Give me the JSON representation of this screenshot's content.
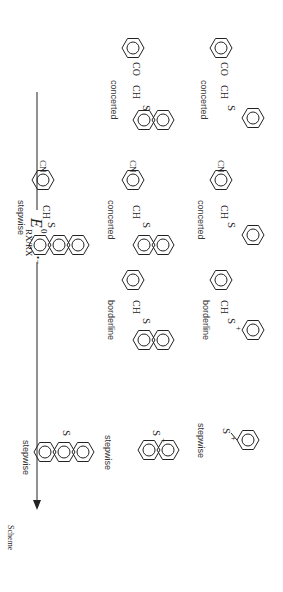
{
  "axis": {
    "label_main": "E",
    "label_sup": "0",
    "label_sub": "RX/RX",
    "label_radical": "•−",
    "direction": "increasing to the right (top-to-bottom in image)"
  },
  "columns": [
    {
      "substituent": "none (S-methyl, S-methyl)",
      "rows": [
        {
          "aryl": "phenyl",
          "label": "stepwise"
        },
        {
          "aryl": "1-naphthyl",
          "label": "stepwise"
        },
        {
          "aryl": "9-anthryl",
          "label": "stepwise"
        }
      ]
    },
    {
      "substituent": "CH2-phenyl",
      "rows": [
        {
          "aryl": "phenyl",
          "label": "borderline"
        },
        {
          "aryl": "1-naphthyl",
          "label": "borderline"
        }
      ]
    },
    {
      "substituent": "CH2-(4-cyanophenyl)",
      "rows": [
        {
          "aryl": "phenyl",
          "label": "concerted"
        },
        {
          "aryl": "1-naphthyl",
          "label": "concerted"
        },
        {
          "aryl": "9-anthryl",
          "label": "stepwise"
        }
      ]
    },
    {
      "substituent": "CH2-CO-phenyl",
      "rows": [
        {
          "aryl": "phenyl",
          "label": "concerted"
        },
        {
          "aryl": "1-naphthyl",
          "label": "concerted"
        }
      ]
    }
  ],
  "atoms": {
    "S": "S",
    "plus": "+",
    "CH2": "CH",
    "sub2": "2",
    "CN": "CN",
    "CO": "CO",
    "dash": "–"
  },
  "footer_fragment": "Scheme"
}
